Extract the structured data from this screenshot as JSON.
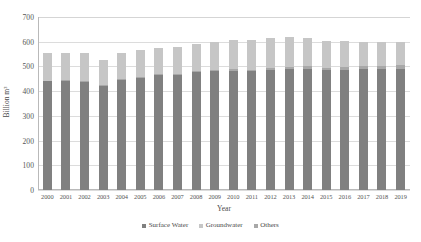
{
  "chart_data": {
    "type": "bar",
    "stacked": true,
    "title": "",
    "subtitle": "",
    "xlabel": "Year",
    "ylabel": "Billion m³",
    "ylim": [
      0,
      700
    ],
    "yticks": [
      0,
      100,
      200,
      300,
      400,
      500,
      600,
      700
    ],
    "grid": true,
    "legend_position": "bottom",
    "categories": [
      "2000",
      "2001",
      "2002",
      "2003",
      "2004",
      "2005",
      "2006",
      "2007",
      "2008",
      "2009",
      "2010",
      "2011",
      "2012",
      "2013",
      "2014",
      "2015",
      "2016",
      "2017",
      "2018",
      "2019"
    ],
    "series": [
      {
        "name": "Surface Water",
        "color": "#808080",
        "values": [
          440,
          442,
          438,
          422,
          447,
          455,
          467,
          466,
          476,
          480,
          483,
          481,
          486,
          491,
          491,
          485,
          486,
          488,
          489,
          490
        ]
      },
      {
        "name": "Groundwater",
        "color": "#c6c6c6",
        "values": [
          110,
          110,
          112,
          101,
          106,
          107,
          106,
          108,
          112,
          115,
          118,
          120,
          122,
          119,
          114,
          107,
          105,
          101,
          98,
          95
        ]
      },
      {
        "name": "Others",
        "color": "#a8a8a8",
        "values": [
          3,
          3,
          3,
          3,
          3,
          3,
          3,
          4,
          4,
          5,
          5,
          6,
          7,
          8,
          9,
          10,
          11,
          12,
          13,
          14
        ]
      }
    ],
    "totals": [
      553,
      555,
      553,
      526,
      556,
      565,
      576,
      578,
      592,
      600,
      606,
      607,
      615,
      618,
      614,
      602,
      602,
      601,
      600,
      599
    ]
  },
  "colors": {
    "surface_water": "#808080",
    "groundwater": "#c6c6c6",
    "others": "#a8a8a8",
    "gridline": "#dcdcdc",
    "axis": "#b9b9b9",
    "text": "#4a4a4a"
  }
}
